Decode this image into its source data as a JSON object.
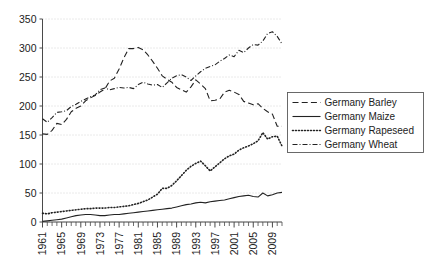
{
  "chart_data": {
    "type": "line",
    "title": "",
    "subtitle": "",
    "xlabel": "",
    "ylabel": "",
    "xlim": [
      1961,
      2011
    ],
    "ylim": [
      0,
      350
    ],
    "yticks": [
      0,
      50,
      100,
      150,
      200,
      250,
      300,
      350
    ],
    "xticks": [
      1961,
      1965,
      1969,
      1973,
      1977,
      1981,
      1985,
      1989,
      1993,
      1997,
      2001,
      2005,
      2009
    ],
    "x": [
      1961,
      1962,
      1963,
      1964,
      1965,
      1966,
      1967,
      1968,
      1969,
      1970,
      1971,
      1972,
      1973,
      1974,
      1975,
      1976,
      1977,
      1978,
      1979,
      1980,
      1981,
      1982,
      1983,
      1984,
      1985,
      1986,
      1987,
      1988,
      1989,
      1990,
      1991,
      1992,
      1993,
      1994,
      1995,
      1996,
      1997,
      1998,
      1999,
      2000,
      2001,
      2002,
      2003,
      2004,
      2005,
      2006,
      2007,
      2008,
      2009,
      2010,
      2011
    ],
    "grid": true,
    "grid_style": "dotted-horizontal",
    "legend_position": "right",
    "series": [
      {
        "name": "Germany Barley",
        "style": "dashed",
        "color": "#222222",
        "values": [
          152,
          151,
          158,
          170,
          168,
          177,
          190,
          196,
          200,
          209,
          214,
          218,
          224,
          229,
          243,
          248,
          264,
          283,
          299,
          299,
          301,
          297,
          288,
          277,
          265,
          252,
          246,
          241,
          232,
          228,
          224,
          233,
          245,
          238,
          230,
          209,
          210,
          212,
          224,
          227,
          224,
          220,
          208,
          205,
          202,
          204,
          196,
          190,
          186,
          165,
          165
        ]
      },
      {
        "name": "Germany Maize",
        "style": "solid",
        "color": "#222222",
        "values": [
          1,
          2,
          3,
          4,
          5,
          7,
          9,
          11,
          12,
          13,
          13,
          12,
          11,
          11,
          12,
          13,
          13,
          14,
          15,
          16,
          17,
          18,
          19,
          20,
          21,
          22,
          23,
          24,
          26,
          28,
          30,
          31,
          33,
          34,
          33,
          35,
          36,
          37,
          38,
          40,
          42,
          44,
          45,
          46,
          44,
          43,
          50,
          45,
          47,
          50,
          51
        ]
      },
      {
        "name": "Germany Rapeseed",
        "style": "dotted",
        "color": "#222222",
        "values": [
          15,
          14,
          16,
          17,
          18,
          19,
          20,
          21,
          22,
          23,
          23,
          24,
          24,
          24,
          25,
          25,
          26,
          27,
          28,
          30,
          32,
          35,
          38,
          43,
          48,
          58,
          58,
          63,
          71,
          80,
          89,
          96,
          101,
          105,
          97,
          88,
          95,
          102,
          109,
          114,
          117,
          124,
          128,
          131,
          135,
          140,
          154,
          143,
          147,
          148,
          131
        ]
      },
      {
        "name": "Germany Wheat",
        "style": "dash-dot",
        "color": "#222222",
        "values": [
          178,
          172,
          180,
          189,
          190,
          192,
          199,
          203,
          208,
          212,
          216,
          219,
          228,
          231,
          228,
          230,
          232,
          231,
          232,
          230,
          237,
          241,
          238,
          236,
          237,
          232,
          240,
          248,
          252,
          254,
          250,
          244,
          252,
          259,
          265,
          268,
          271,
          277,
          282,
          288,
          285,
          296,
          292,
          300,
          306,
          305,
          312,
          325,
          328,
          320,
          307
        ]
      }
    ]
  },
  "legend": {
    "items": [
      {
        "label": "Germany Barley",
        "style": "dashed"
      },
      {
        "label": "Germany Maize",
        "style": "solid"
      },
      {
        "label": "Germany Rapeseed",
        "style": "dotted"
      },
      {
        "label": "Germany Wheat",
        "style": "dash-dot"
      }
    ]
  },
  "axis": {
    "y_tick_labels": [
      "350",
      "300",
      "250",
      "200",
      "150",
      "100",
      "50",
      "0"
    ],
    "x_tick_labels": [
      "1961",
      "1965",
      "1969",
      "1973",
      "1977",
      "1981",
      "1985",
      "1989",
      "1993",
      "1997",
      "2001",
      "2005",
      "2009"
    ]
  },
  "colors": {
    "line": "#222222",
    "grid": "#c9c9c9",
    "axis": "#4a4a4a",
    "background": "#ffffff",
    "legend_border": "#5a5a5a"
  }
}
